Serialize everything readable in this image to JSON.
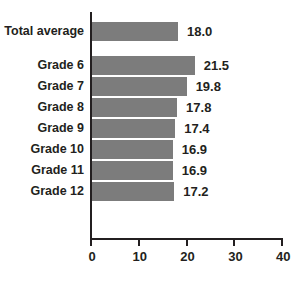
{
  "chart_data": {
    "type": "bar",
    "orientation": "horizontal",
    "title": "",
    "xlabel": "",
    "ylabel": "",
    "xlim": [
      0,
      40
    ],
    "xticks": [
      0,
      10,
      20,
      30,
      40
    ],
    "xtick_labels": [
      "0",
      "10",
      "20",
      "30",
      "40"
    ],
    "grid": false,
    "legend": null,
    "bar_color": "#7c7c7c",
    "axis_color": "#231f20",
    "text_color": "#231f20",
    "categories": [
      "Total average",
      "Grade 6",
      "Grade 7",
      "Grade 8",
      "Grade 9",
      "Grade 10",
      "Grade 11",
      "Grade 12"
    ],
    "values": [
      18.0,
      21.5,
      19.8,
      17.8,
      17.4,
      16.9,
      16.9,
      17.2
    ],
    "value_labels": [
      "18.0",
      "21.5",
      "19.8",
      "17.8",
      "17.4",
      "16.9",
      "16.9",
      "17.2"
    ],
    "bars": [
      {
        "label": "Total average",
        "value": 18.0,
        "value_label": "18.0"
      },
      {
        "label": "Grade 6",
        "value": 21.5,
        "value_label": "21.5"
      },
      {
        "label": "Grade 7",
        "value": 19.8,
        "value_label": "19.8"
      },
      {
        "label": "Grade 8",
        "value": 17.8,
        "value_label": "17.8"
      },
      {
        "label": "Grade 9",
        "value": 17.4,
        "value_label": "17.4"
      },
      {
        "label": "Grade 10",
        "value": 16.9,
        "value_label": "16.9"
      },
      {
        "label": "Grade 11",
        "value": 16.9,
        "value_label": "16.9"
      },
      {
        "label": "Grade 12",
        "value": 17.2,
        "value_label": "17.2"
      }
    ]
  }
}
